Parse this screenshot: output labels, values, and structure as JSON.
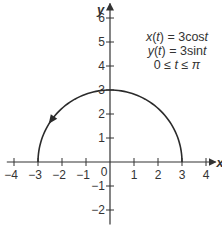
{
  "chart_data": {
    "type": "line",
    "title": "",
    "xlabel": "x",
    "ylabel": "y",
    "xlim": [
      -4.3,
      4.4
    ],
    "ylim": [
      -2.6,
      6.6
    ],
    "grid": false,
    "x_ticks": [
      -4,
      -3,
      -2,
      -1,
      0,
      1,
      2,
      3,
      4
    ],
    "x_tick_labels": [
      "−4",
      "−3",
      "−2",
      "−1",
      "0",
      "1",
      "2",
      "3",
      "4"
    ],
    "y_ticks": [
      -2,
      -1,
      1,
      2,
      3,
      4,
      5,
      6
    ],
    "y_tick_labels": [
      "−2",
      "−1",
      "1",
      "2",
      "3",
      "4",
      "5",
      "6"
    ],
    "annotations": [
      "x(t) = 3cost",
      "y(t) = 3sint",
      "0 ≤ t ≤ π"
    ],
    "series": [
      {
        "name": "Upper semicircle (parametric, counterclockwise)",
        "parametric": {
          "x": "3cos(t)",
          "y": "3sin(t)",
          "t_range": [
            0,
            3.14159
          ]
        },
        "x": [
          3,
          2.85,
          2.43,
          1.76,
          0.93,
          0,
          -0.93,
          -1.76,
          -2.43,
          -2.85,
          -3
        ],
        "y": [
          0,
          0.93,
          1.76,
          2.43,
          2.85,
          3,
          2.85,
          2.43,
          1.76,
          0.93,
          0
        ],
        "direction_arrow": {
          "at": [
            -2.43,
            1.76
          ],
          "direction": "counterclockwise"
        }
      }
    ]
  },
  "legend": {
    "line1": "x(t) = 3cost",
    "line2": "y(t) = 3sint",
    "line3": "0 ≤ t ≤ π"
  },
  "axes": {
    "x_label": "x",
    "y_label": "y"
  },
  "colors": {
    "curve": "#2b2b2b",
    "axis": "#333333",
    "text": "#333333",
    "background": "#ffffff"
  }
}
